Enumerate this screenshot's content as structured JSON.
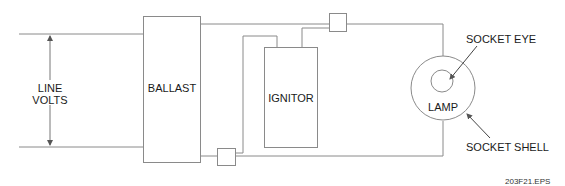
{
  "diagram": {
    "type": "wiring-schematic",
    "components": {
      "line_volts": {
        "label_line1": "LINE",
        "label_line2": "VOLTS"
      },
      "ballast": {
        "label": "BALLAST"
      },
      "ignitor": {
        "label": "IGNITOR"
      },
      "lamp": {
        "label": "LAMP"
      },
      "socket_eye": {
        "label": "SOCKET EYE"
      },
      "socket_shell": {
        "label": "SOCKET SHELL"
      }
    },
    "figure_id": "203F21.EPS",
    "colors": {
      "line": "#8a8a8a",
      "text": "#1a1a1a",
      "background": "#ffffff"
    }
  }
}
